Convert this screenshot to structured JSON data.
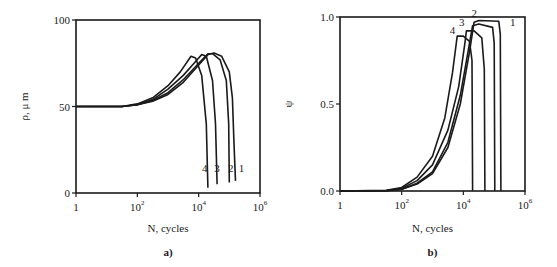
{
  "chart_data": [
    {
      "panel": "a)",
      "type": "line",
      "xlabel": "N, cycles",
      "ylabel": "ρ, μ m",
      "xscale": "log",
      "xlim_log10": [
        0,
        6
      ],
      "ylim": [
        0,
        100
      ],
      "x_ticks": [
        {
          "exp": 0,
          "label": "1"
        },
        {
          "exp": 2,
          "label": "10",
          "sup": "2"
        },
        {
          "exp": 4,
          "label": "10",
          "sup": "4"
        },
        {
          "exp": 6,
          "label": "10",
          "sup": "6"
        }
      ],
      "y_ticks": [
        {
          "v": 0,
          "label": "0"
        },
        {
          "v": 50,
          "label": "50"
        },
        {
          "v": 100,
          "label": "100"
        }
      ],
      "series": [
        {
          "name": "1",
          "label_pos": [
            5.4,
            12
          ],
          "points_log10x": [
            [
              0,
              50
            ],
            [
              1.5,
              50
            ],
            [
              2.0,
              51
            ],
            [
              2.5,
              53
            ],
            [
              3.0,
              57
            ],
            [
              3.5,
              64
            ],
            [
              4.0,
              74
            ],
            [
              4.3,
              80
            ],
            [
              4.5,
              81
            ],
            [
              4.75,
              79
            ],
            [
              5.0,
              70
            ],
            [
              5.1,
              55
            ],
            [
              5.15,
              30
            ],
            [
              5.2,
              7
            ]
          ]
        },
        {
          "name": "2",
          "label_pos": [
            5.05,
            12
          ],
          "points_log10x": [
            [
              0,
              50
            ],
            [
              1.5,
              50
            ],
            [
              2.0,
              51
            ],
            [
              2.5,
              53.5
            ],
            [
              3.0,
              58
            ],
            [
              3.5,
              65.5
            ],
            [
              4.0,
              75
            ],
            [
              4.3,
              80.5
            ],
            [
              4.45,
              80.5
            ],
            [
              4.7,
              77
            ],
            [
              4.9,
              65
            ],
            [
              4.98,
              40
            ],
            [
              5.0,
              6
            ]
          ]
        },
        {
          "name": "3",
          "label_pos": [
            4.6,
            12
          ],
          "points_log10x": [
            [
              0,
              50
            ],
            [
              1.5,
              50
            ],
            [
              2.0,
              51
            ],
            [
              2.5,
              54
            ],
            [
              3.0,
              60
            ],
            [
              3.5,
              68
            ],
            [
              3.9,
              76
            ],
            [
              4.1,
              80
            ],
            [
              4.25,
              79
            ],
            [
              4.45,
              65
            ],
            [
              4.55,
              40
            ],
            [
              4.6,
              5
            ]
          ]
        },
        {
          "name": "4",
          "label_pos": [
            4.2,
            12
          ],
          "points_log10x": [
            [
              0,
              50
            ],
            [
              1.5,
              50
            ],
            [
              2.0,
              51.5
            ],
            [
              2.5,
              55
            ],
            [
              3.0,
              62
            ],
            [
              3.4,
              70
            ],
            [
              3.75,
              79
            ],
            [
              3.9,
              78
            ],
            [
              4.1,
              68
            ],
            [
              4.25,
              40
            ],
            [
              4.3,
              3
            ]
          ]
        }
      ]
    },
    {
      "panel": "b)",
      "type": "line",
      "xlabel": "N, cycles",
      "ylabel": "ψ",
      "xscale": "log",
      "xlim_log10": [
        0,
        6
      ],
      "ylim": [
        0,
        1.0
      ],
      "x_ticks": [
        {
          "exp": 0,
          "label": "1"
        },
        {
          "exp": 2,
          "label": "10",
          "sup": "2"
        },
        {
          "exp": 4,
          "label": "10",
          "sup": "4"
        },
        {
          "exp": 6,
          "label": "10",
          "sup": "6"
        }
      ],
      "y_ticks": [
        {
          "v": 0,
          "label": "0.0"
        },
        {
          "v": 0.5,
          "label": "0.5"
        },
        {
          "v": 1.0,
          "label": "1.0"
        }
      ],
      "series": [
        {
          "name": "1",
          "label_pos": [
            5.6,
            0.95
          ],
          "points_log10x": [
            [
              0,
              0
            ],
            [
              1.5,
              0.002
            ],
            [
              2.0,
              0.01
            ],
            [
              2.5,
              0.04
            ],
            [
              3.0,
              0.1
            ],
            [
              3.5,
              0.25
            ],
            [
              3.9,
              0.5
            ],
            [
              4.2,
              0.8
            ],
            [
              4.35,
              0.97
            ],
            [
              4.5,
              0.98
            ],
            [
              5.15,
              0.975
            ],
            [
              5.2,
              0.9
            ],
            [
              5.22,
              0
            ]
          ]
        },
        {
          "name": "2",
          "label_pos": [
            4.35,
            1.0
          ],
          "points_log10x": [
            [
              0,
              0
            ],
            [
              1.5,
              0.002
            ],
            [
              2.0,
              0.01
            ],
            [
              2.5,
              0.045
            ],
            [
              3.0,
              0.11
            ],
            [
              3.5,
              0.28
            ],
            [
              3.9,
              0.55
            ],
            [
              4.15,
              0.8
            ],
            [
              4.3,
              0.95
            ],
            [
              4.5,
              0.96
            ],
            [
              4.95,
              0.94
            ],
            [
              5.0,
              0.85
            ],
            [
              5.02,
              0
            ]
          ]
        },
        {
          "name": "3",
          "label_pos": [
            3.95,
            0.95
          ],
          "points_log10x": [
            [
              0,
              0
            ],
            [
              1.5,
              0.003
            ],
            [
              2.0,
              0.015
            ],
            [
              2.5,
              0.06
            ],
            [
              3.0,
              0.15
            ],
            [
              3.5,
              0.35
            ],
            [
              3.85,
              0.6
            ],
            [
              4.05,
              0.85
            ],
            [
              4.1,
              0.92
            ],
            [
              4.35,
              0.92
            ],
            [
              4.6,
              0.88
            ],
            [
              4.68,
              0.7
            ],
            [
              4.7,
              0
            ]
          ]
        },
        {
          "name": "4",
          "label_pos": [
            3.65,
            0.9
          ],
          "points_log10x": [
            [
              0,
              0
            ],
            [
              1.5,
              0.004
            ],
            [
              2.0,
              0.02
            ],
            [
              2.5,
              0.08
            ],
            [
              3.0,
              0.2
            ],
            [
              3.4,
              0.42
            ],
            [
              3.65,
              0.68
            ],
            [
              3.8,
              0.89
            ],
            [
              4.0,
              0.89
            ],
            [
              4.2,
              0.86
            ],
            [
              4.28,
              0.75
            ],
            [
              4.3,
              0
            ]
          ]
        }
      ]
    }
  ],
  "panels": {
    "a": {
      "caption": "a)",
      "xlabel": "N, cycles",
      "ylabel": "ρ, μ m"
    },
    "b": {
      "caption": "b)",
      "xlabel": "N, cycles",
      "ylabel": "ψ"
    }
  }
}
